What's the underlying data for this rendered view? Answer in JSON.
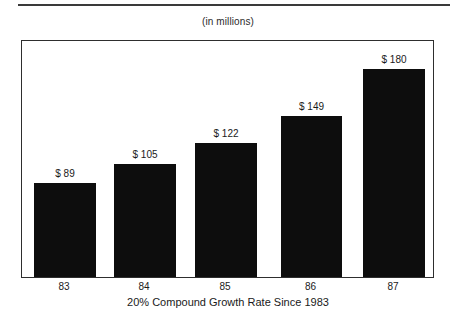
{
  "top_rule": {
    "color": "#3a3a3a"
  },
  "header": {
    "units_caption": "(in millions)"
  },
  "footer": {
    "caption": "20% Compound Growth Rate Since 1983"
  },
  "colors": {
    "bar": "#0d0d0d",
    "frame": "#2e2e2e",
    "text": "#1a1a1a",
    "background": "#ffffff"
  },
  "chart_data": {
    "type": "bar",
    "title": "",
    "subtitle": "(in millions)",
    "xlabel": "20% Compound Growth Rate Since 1983",
    "ylabel": "",
    "categories": [
      "83",
      "84",
      "85",
      "86",
      "87"
    ],
    "values": [
      89,
      105,
      122,
      149,
      180
    ],
    "value_labels": [
      "$ 89",
      "$ 105",
      "$ 122",
      "$ 149",
      "$ 180"
    ],
    "ylim": [
      0,
      206
    ],
    "grid": false,
    "legend": false,
    "series": [
      {
        "name": "Revenue",
        "values": [
          89,
          105,
          122,
          149,
          180
        ]
      }
    ],
    "bars": [
      {
        "category": "83",
        "value": 89,
        "label": "$ 89",
        "left_px": 12,
        "width_px": 62,
        "height_px": 94
      },
      {
        "category": "84",
        "value": 105,
        "label": "$ 105",
        "left_px": 92,
        "width_px": 62,
        "height_px": 113
      },
      {
        "category": "85",
        "value": 122,
        "label": "$ 122",
        "left_px": 173,
        "width_px": 62,
        "height_px": 134
      },
      {
        "category": "86",
        "value": 149,
        "label": "$ 149",
        "left_px": 259,
        "width_px": 61,
        "height_px": 161
      },
      {
        "category": "87",
        "value": 180,
        "label": "$ 180",
        "left_px": 341,
        "width_px": 62,
        "height_px": 208
      }
    ]
  }
}
